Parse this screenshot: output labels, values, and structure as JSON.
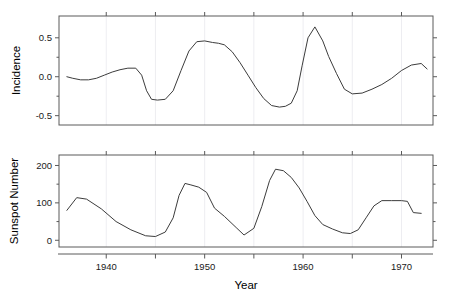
{
  "figure": {
    "width": 450,
    "height": 307,
    "background": "#ffffff",
    "line_color": "#3c3c3c",
    "frame_color": "#5a5a5a",
    "gridline_color": "#e8e8ee"
  },
  "panels": [
    {
      "name": "incidence-panel",
      "ylabel": "Incidence",
      "ytick_labels": [
        "0.5",
        "0.0",
        "-0.5"
      ],
      "ytick_values": [
        0.5,
        0.0,
        -0.5
      ],
      "ylim": [
        -0.62,
        0.78
      ],
      "xlim": [
        1935.2,
        1973.2
      ],
      "xtick_values": [
        1940,
        1945,
        1950,
        1955,
        1960,
        1965,
        1970
      ],
      "plot_box": {
        "x": 59,
        "y": 16,
        "w": 374,
        "h": 109
      }
    },
    {
      "name": "sunspot-panel",
      "ylabel": "Sunspot Number",
      "ytick_labels": [
        "200",
        "100",
        "0"
      ],
      "ytick_values": [
        200,
        100,
        0
      ],
      "ylim": [
        -18,
        228
      ],
      "xlim": [
        1935.2,
        1973.2
      ],
      "xtick_values": [
        1940,
        1945,
        1950,
        1955,
        1960,
        1965,
        1970
      ],
      "plot_box": {
        "x": 59,
        "y": 155,
        "w": 374,
        "h": 92
      }
    }
  ],
  "xaxis": {
    "label": "Year",
    "tick_labels": [
      "1940",
      "1950",
      "1960",
      "1970"
    ],
    "tick_label_values": [
      1940,
      1950,
      1960,
      1970
    ],
    "minor_tick_values": [
      1945,
      1955,
      1965
    ]
  },
  "chart_data": [
    {
      "type": "line",
      "title": "",
      "xlabel": "Year",
      "ylabel": "Incidence",
      "xlim": [
        1935.2,
        1973.2
      ],
      "ylim": [
        -0.62,
        0.78
      ],
      "grid": true,
      "legend": "none",
      "x": [
        1936,
        1937,
        1938,
        1939,
        1940,
        1941,
        1942,
        1943,
        1944,
        1945,
        1946,
        1947,
        1948,
        1949,
        1950,
        1951,
        1952,
        1953,
        1954,
        1955,
        1956,
        1957,
        1958,
        1959,
        1960,
        1961,
        1962,
        1963,
        1964,
        1965,
        1966,
        1967,
        1968,
        1969,
        1970,
        1971,
        1972
      ],
      "values": [
        0.0,
        -0.03,
        -0.05,
        -0.04,
        0.01,
        0.06,
        0.1,
        0.11,
        0.11,
        -0.18,
        -0.29,
        -0.29,
        -0.28,
        0.0,
        0.3,
        0.46,
        0.45,
        0.44,
        0.4,
        0.22,
        0.02,
        -0.16,
        -0.31,
        -0.39,
        -0.39,
        -0.35,
        -0.33,
        -0.06,
        0.26,
        0.52,
        0.64,
        0.48,
        0.28,
        0.06,
        -0.2,
        -0.22,
        -0.22
      ],
      "values_tail_x": [
        1967,
        1968,
        1969,
        1970,
        1971,
        1972
      ],
      "values_tail": [
        -0.18,
        -0.12,
        -0.04,
        0.06,
        0.14,
        0.17
      ]
    },
    {
      "type": "line",
      "title": "",
      "xlabel": "Year",
      "ylabel": "Sunspot Number",
      "xlim": [
        1935.2,
        1973.2
      ],
      "ylim": [
        -18,
        228
      ],
      "grid": true,
      "legend": "none",
      "x": [
        1936,
        1937,
        1938,
        1939,
        1940,
        1941,
        1942,
        1943,
        1944,
        1945,
        1946,
        1947,
        1948,
        1949,
        1950,
        1951,
        1952,
        1953,
        1954,
        1955,
        1956,
        1957,
        1958,
        1959,
        1960,
        1961,
        1962,
        1963,
        1964,
        1965,
        1966,
        1967,
        1968,
        1969,
        1970,
        1971,
        1972
      ],
      "values": [
        80,
        114,
        110,
        90,
        68,
        48,
        31,
        17,
        10,
        10,
        33,
        93,
        152,
        137,
        134,
        84,
        69,
        32,
        14,
        38,
        142,
        190,
        185,
        159,
        112,
        54,
        38,
        28,
        10,
        15,
        47,
        94,
        106,
        106,
        105,
        67,
        69
      ]
    }
  ],
  "incidence_series": {
    "x": [
      1936.0,
      1936.6,
      1937.4,
      1938.2,
      1939.0,
      1939.8,
      1940.6,
      1941.4,
      1942.2,
      1943.0,
      1943.6,
      1944.1,
      1944.6,
      1945.2,
      1946.0,
      1946.8,
      1947.6,
      1948.4,
      1949.2,
      1950.0,
      1950.8,
      1951.4,
      1952.0,
      1952.8,
      1953.6,
      1954.4,
      1955.2,
      1956.0,
      1956.8,
      1957.6,
      1958.2,
      1958.8,
      1959.4,
      1959.9,
      1960.5,
      1961.2,
      1962.0,
      1962.6,
      1963.4,
      1964.2,
      1965.0,
      1966.0,
      1967.0,
      1968.0,
      1969.0,
      1970.0,
      1971.0,
      1972.0,
      1972.6
    ],
    "y": [
      0.0,
      -0.02,
      -0.04,
      -0.04,
      -0.02,
      0.02,
      0.06,
      0.09,
      0.11,
      0.11,
      0.02,
      -0.18,
      -0.29,
      -0.3,
      -0.29,
      -0.18,
      0.08,
      0.33,
      0.45,
      0.46,
      0.44,
      0.43,
      0.41,
      0.32,
      0.18,
      0.02,
      -0.14,
      -0.28,
      -0.37,
      -0.39,
      -0.38,
      -0.34,
      -0.18,
      0.14,
      0.5,
      0.64,
      0.46,
      0.26,
      0.04,
      -0.16,
      -0.22,
      -0.21,
      -0.16,
      -0.1,
      -0.02,
      0.08,
      0.15,
      0.17,
      0.1
    ]
  },
  "sunspot_series": {
    "x": [
      1936.0,
      1937.0,
      1938.0,
      1939.5,
      1941.0,
      1942.5,
      1944.0,
      1945.0,
      1946.0,
      1946.8,
      1947.4,
      1948.0,
      1948.6,
      1949.4,
      1950.2,
      1951.0,
      1952.0,
      1953.2,
      1954.0,
      1955.0,
      1955.8,
      1956.6,
      1957.2,
      1958.0,
      1958.8,
      1959.6,
      1960.4,
      1961.2,
      1962.0,
      1963.0,
      1964.0,
      1964.8,
      1965.6,
      1966.4,
      1967.2,
      1968.0,
      1969.0,
      1970.0,
      1970.6,
      1971.2,
      1972.0
    ],
    "y": [
      80,
      114,
      110,
      84,
      50,
      28,
      12,
      10,
      22,
      60,
      120,
      152,
      148,
      142,
      128,
      86,
      64,
      34,
      14,
      32,
      90,
      160,
      190,
      186,
      168,
      140,
      104,
      66,
      42,
      30,
      20,
      18,
      28,
      60,
      92,
      106,
      106,
      106,
      104,
      74,
      72
    ]
  }
}
